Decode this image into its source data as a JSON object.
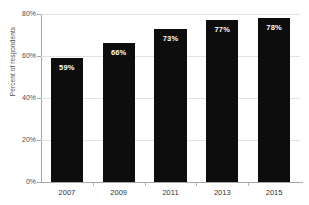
{
  "chart_data": {
    "type": "bar",
    "title": "",
    "xlabel": "",
    "ylabel": "Percent of respondents",
    "categories": [
      "2007",
      "2009",
      "2011",
      "2013",
      "2015"
    ],
    "values": [
      59,
      66,
      73,
      77,
      78
    ],
    "data_labels": [
      "59%",
      "66%",
      "73%",
      "77%",
      "78%"
    ],
    "ylim": [
      0,
      80
    ],
    "ytick_labels": [
      "0%",
      "20%",
      "40%",
      "60%",
      "80%"
    ],
    "ytick_values": [
      0,
      20,
      40,
      60,
      80
    ],
    "grid": true,
    "legend": null,
    "series": [
      {
        "name": "Percent of respondents",
        "values": [
          59,
          66,
          73,
          77,
          78
        ],
        "color": "#0d0d0d"
      }
    ]
  },
  "colors": {
    "bar": "#0d0d0d",
    "gridline": "#e2e2e2",
    "axis": "#a6a6a6",
    "label_text": "#4d4d4d",
    "bar_label_text": "#ffffff",
    "background": "#ffffff"
  },
  "title_sliver": {
    "text": ""
  }
}
